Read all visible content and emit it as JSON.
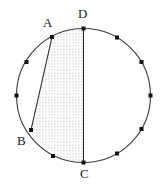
{
  "figure": {
    "kind": "circle-geometry-diagram",
    "width": 163,
    "height": 188,
    "background_color": "#ffffff",
    "stroke_color": "#3a3a3a",
    "label_color": "#1a1a1a",
    "shading_color": "#d8d8d8",
    "shading_style": "stippled-dots"
  },
  "circle": {
    "center_x": 83.5,
    "center_y": 95.5,
    "radius": 67,
    "stroke_width": 1.1
  },
  "labels": {
    "A": "A",
    "B": "B",
    "C": "C",
    "D": "D"
  },
  "vertices": [
    {
      "name": "A",
      "x": 52,
      "y": 37
    },
    {
      "name": "B",
      "x": 31,
      "y": 130
    },
    {
      "name": "C",
      "x": 83.5,
      "y": 162.5
    },
    {
      "name": "D",
      "x": 83.5,
      "y": 28.5
    }
  ],
  "segments": [
    {
      "name": "chord-AB",
      "from": "A",
      "to": "B",
      "x1": 52,
      "y1": 37,
      "x2": 31,
      "y2": 130
    },
    {
      "name": "diameter-CD",
      "from": "D",
      "to": "C",
      "x1": 83.5,
      "y1": 28.5,
      "x2": 83.5,
      "y2": 162.5
    }
  ],
  "marked_points": [
    {
      "index": 0,
      "x": 83.5,
      "y": 28.5
    },
    {
      "index": 1,
      "x": 117,
      "y": 37.5
    },
    {
      "index": 2,
      "x": 141.5,
      "y": 62
    },
    {
      "index": 3,
      "x": 150.5,
      "y": 95.5
    },
    {
      "index": 4,
      "x": 141.5,
      "y": 129
    },
    {
      "index": 5,
      "x": 117,
      "y": 153.5
    },
    {
      "index": 6,
      "x": 83.5,
      "y": 162.5
    },
    {
      "index": 7,
      "x": 53,
      "y": 156
    },
    {
      "index": 8,
      "x": 31,
      "y": 130
    },
    {
      "index": 9,
      "x": 16.5,
      "y": 95.5
    },
    {
      "index": 10,
      "x": 26.5,
      "y": 62
    },
    {
      "index": 11,
      "x": 52,
      "y": 37
    }
  ],
  "shaded_region": {
    "name": "shaded-region",
    "description": "Region bounded by chord AB, arc B to C, diameter C to D, and arc D to A",
    "fill": "#dcdcdc"
  }
}
